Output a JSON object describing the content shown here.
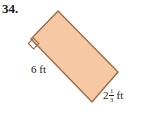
{
  "exercise": {
    "number": "34."
  },
  "figure": {
    "type": "rectangle",
    "fill_color": "#F6C9A4",
    "stroke_color": "#9C6B47",
    "background_color": "#FFFFFF",
    "vertices": {
      "top": [
        58,
        11
      ],
      "right": [
        118,
        72
      ],
      "bottom": [
        92,
        102
      ],
      "left": [
        31,
        39
      ]
    },
    "right_angle_marker": {
      "at_vertex": "left",
      "shown": true
    }
  },
  "labels": {
    "long_side": {
      "text": "6 ft",
      "value": 6,
      "unit": "ft"
    },
    "short_side": {
      "whole": "2",
      "numerator": "1",
      "denominator": "3",
      "unit": "ft",
      "text": "2 1/3 ft"
    }
  }
}
